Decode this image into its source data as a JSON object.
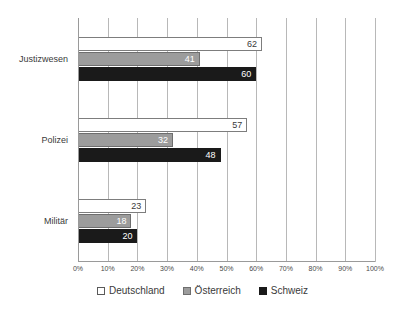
{
  "chart_data": {
    "type": "bar",
    "orientation": "horizontal",
    "title": "",
    "subtitle": "",
    "xlabel": "",
    "ylabel": "",
    "xlim": [
      0,
      100
    ],
    "xtick_labels": [
      "0%",
      "10%",
      "20%",
      "30%",
      "40%",
      "50%",
      "60%",
      "70%",
      "80%",
      "90%",
      "100%"
    ],
    "xtick_values": [
      0,
      10,
      20,
      30,
      40,
      50,
      60,
      70,
      80,
      90,
      100
    ],
    "grid": true,
    "grid_axis": "x",
    "legend_position": "bottom",
    "categories": [
      "Justizwesen",
      "Polizei",
      "Militär"
    ],
    "series": [
      {
        "name": "Deutschland",
        "color": "#ffffff",
        "values": [
          62,
          57,
          23
        ]
      },
      {
        "name": "Österreich",
        "color": "#9c9c9c",
        "values": [
          41,
          32,
          18
        ]
      },
      {
        "name": "Schweiz",
        "color": "#1a1a1a",
        "values": [
          60,
          48,
          20
        ]
      }
    ]
  },
  "legend": {
    "items": [
      {
        "label": "Deutschland"
      },
      {
        "label": "Österreich"
      },
      {
        "label": "Schweiz"
      }
    ]
  }
}
